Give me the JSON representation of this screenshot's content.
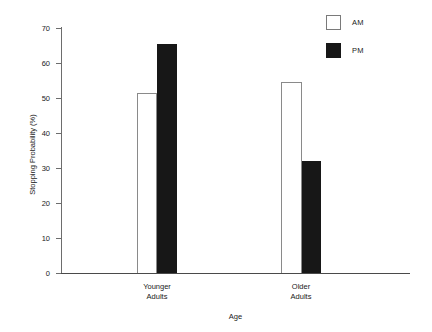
{
  "chart_data": {
    "type": "bar",
    "title": "",
    "xlabel": "Age",
    "ylabel": "Stopping Probability (%)",
    "categories": [
      "Younger\nAdults",
      "Older\nAdults"
    ],
    "category_labels": [
      {
        "line1": "Younger",
        "line2": "Adults"
      },
      {
        "line1": "Older",
        "line2": "Adults"
      }
    ],
    "series": [
      {
        "name": "AM",
        "values": [
          51.5,
          54.5
        ],
        "color": "#ffffff",
        "edge_color": "#8a8a8a"
      },
      {
        "name": "PM",
        "values": [
          65.5,
          32.0
        ],
        "color": "#171717",
        "edge_color": "#171717"
      }
    ],
    "ylim": [
      0,
      70
    ],
    "ytick_values": [
      0,
      10,
      20,
      30,
      40,
      50,
      60,
      70
    ],
    "ytick_labels": [
      "0",
      "10",
      "20",
      "30",
      "40",
      "50",
      "60",
      "70"
    ],
    "grid": false,
    "legend_position": "top-right"
  },
  "legend": {
    "entries": [
      {
        "label": "AM",
        "swatch": "white-square-swatch"
      },
      {
        "label": "PM",
        "swatch": "black-square-swatch"
      }
    ]
  },
  "axes": {
    "y_axis_label": "Stopping Probability (%)",
    "x_axis_label": "Age"
  },
  "colors": {
    "am_fill": "#ffffff",
    "pm_fill": "#171717",
    "axis": "#4a4a4a",
    "text": "#1a1a1a",
    "background": "#ffffff"
  }
}
